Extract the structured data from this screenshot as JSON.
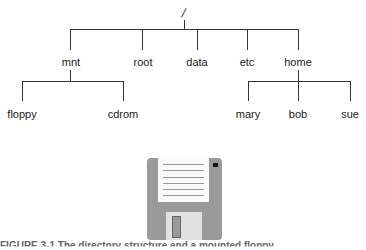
{
  "tree": {
    "root": "/",
    "level1": [
      "mnt",
      "root",
      "data",
      "etc",
      "home"
    ],
    "mnt_children": [
      "floppy",
      "cdrom"
    ],
    "home_children": [
      "mary",
      "bob",
      "sue"
    ]
  },
  "figure": {
    "icon": "floppy-disk-icon",
    "caption": "FIGURE 3-1  The directory structure and a mounted floppy"
  }
}
